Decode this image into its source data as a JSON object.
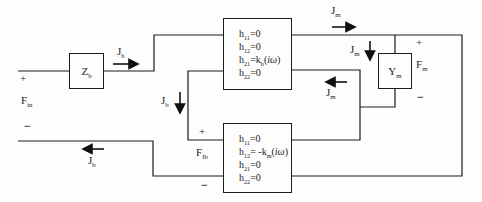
{
  "figure": {
    "background": "#fdfdfd",
    "line_color": "#1c1c1c"
  },
  "blocks": {
    "zb": {
      "label": [
        {
          "t": "Z"
        },
        {
          "t": "b",
          "sub": true
        }
      ]
    },
    "top_hbox": {
      "lines": [
        [
          {
            "t": "h"
          },
          {
            "t": "11",
            "sub": true
          },
          {
            "t": "=0"
          }
        ],
        [
          {
            "t": "h"
          },
          {
            "t": "12",
            "sub": true
          },
          {
            "t": "=0"
          }
        ],
        [
          {
            "t": "h"
          },
          {
            "t": "21",
            "sub": true
          },
          {
            "t": "=k"
          },
          {
            "t": "b",
            "sub": true
          },
          {
            "t": "("
          },
          {
            "t": "iω",
            "i": true
          },
          {
            "t": ")"
          }
        ],
        [
          {
            "t": "h"
          },
          {
            "t": "22",
            "sub": true
          },
          {
            "t": "=0"
          }
        ]
      ]
    },
    "bottom_hbox": {
      "lines": [
        [
          {
            "t": "h"
          },
          {
            "t": "11",
            "sub": true
          },
          {
            "t": "=0"
          }
        ],
        [
          {
            "t": "h"
          },
          {
            "t": "12",
            "sub": true
          },
          {
            "t": "= -k"
          },
          {
            "t": "m",
            "sub": true
          },
          {
            "t": "("
          },
          {
            "t": "iω",
            "i": true
          },
          {
            "t": ")"
          }
        ],
        [
          {
            "t": "h"
          },
          {
            "t": "21",
            "sub": true
          },
          {
            "t": "=0"
          }
        ],
        [
          {
            "t": "h"
          },
          {
            "t": "22",
            "sub": true
          },
          {
            "t": "=0"
          }
        ]
      ]
    },
    "ym": {
      "label": [
        {
          "t": "Y"
        },
        {
          "t": "m",
          "sub": true
        }
      ]
    }
  },
  "currents": {
    "jb": [
      {
        "t": "J"
      },
      {
        "t": "b",
        "sub": true
      }
    ],
    "jm": [
      {
        "t": "J"
      },
      {
        "t": "m",
        "sub": true
      }
    ]
  },
  "ports": {
    "f_in": {
      "plus": "+",
      "label": [
        {
          "t": "F"
        },
        {
          "t": "in",
          "sub": true
        }
      ],
      "minus": "−"
    },
    "f_fb": {
      "plus": "+",
      "label": [
        {
          "t": "F"
        },
        {
          "t": "fb",
          "sub": true
        }
      ],
      "minus": "−"
    },
    "f_m": {
      "plus": "+",
      "label": [
        {
          "t": "F"
        },
        {
          "t": "m",
          "sub": true
        }
      ],
      "minus": "−"
    }
  }
}
